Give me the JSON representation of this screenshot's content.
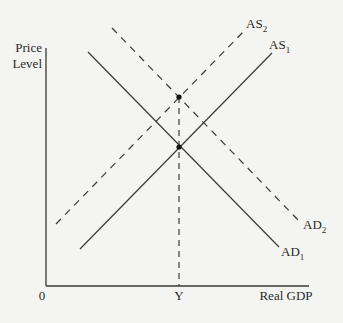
{
  "diagram": {
    "type": "AD-AS model",
    "y_axis_label_line1": "Price",
    "y_axis_label_line2": "Level",
    "x_axis_label": "Real GDP",
    "origin_label": "0",
    "equilibrium_output_label": "Y",
    "curves": {
      "as2": {
        "name": "AS",
        "sub": "2",
        "style": "dashed"
      },
      "as1": {
        "name": "AS",
        "sub": "1",
        "style": "solid"
      },
      "ad2": {
        "name": "AD",
        "sub": "2",
        "style": "dashed"
      },
      "ad1": {
        "name": "AD",
        "sub": "1",
        "style": "solid"
      }
    },
    "colors": {
      "line": "#3a3a3a",
      "background": "#f4f4f2"
    }
  }
}
